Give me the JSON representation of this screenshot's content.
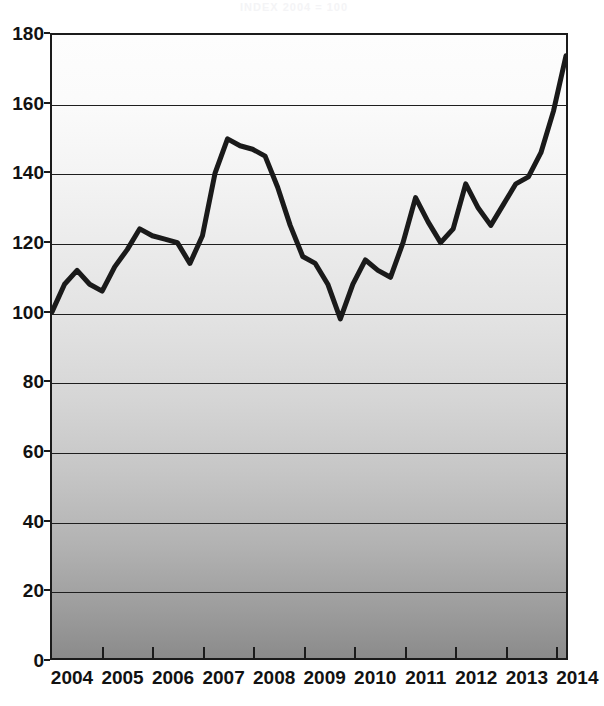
{
  "title": "INDEX 2004 = 100",
  "axes": {
    "y_ticks": [
      180,
      160,
      140,
      120,
      100,
      80,
      60,
      40,
      20,
      0
    ],
    "x_ticks": [
      "2004",
      "2005",
      "2006",
      "2007",
      "2008",
      "2009",
      "2010",
      "2011",
      "2012",
      "2013",
      "2014"
    ]
  },
  "chart_data": {
    "type": "line",
    "title": "INDEX 2004 = 100",
    "xlabel": "",
    "ylabel": "",
    "ylim": [
      0,
      180
    ],
    "xlim": [
      2004,
      2014.25
    ],
    "ytick_step": 20,
    "grid": true,
    "legend": "none",
    "line_color": "#1a1a1a",
    "line_width_px": 5,
    "background_gradient": [
      "#fdfdfd",
      "#8b8b8b"
    ],
    "x_unit": "quarter",
    "categories": [
      "2004 Q1",
      "2004 Q2",
      "2004 Q3",
      "2004 Q4",
      "2005 Q1",
      "2005 Q2",
      "2005 Q3",
      "2005 Q4",
      "2006 Q1",
      "2006 Q2",
      "2006 Q3",
      "2006 Q4",
      "2007 Q1",
      "2007 Q2",
      "2007 Q3",
      "2007 Q4",
      "2008 Q1",
      "2008 Q2",
      "2008 Q3",
      "2008 Q4",
      "2009 Q1",
      "2009 Q2",
      "2009 Q3",
      "2009 Q4",
      "2010 Q1",
      "2010 Q2",
      "2010 Q3",
      "2010 Q4",
      "2011 Q1",
      "2011 Q2",
      "2011 Q3",
      "2011 Q4",
      "2012 Q1",
      "2012 Q2",
      "2012 Q3",
      "2012 Q4",
      "2013 Q1",
      "2013 Q2",
      "2013 Q3",
      "2013 Q4",
      "2014 Q1",
      "2014 Q2"
    ],
    "x": [
      2004.0,
      2004.25,
      2004.5,
      2004.75,
      2005.0,
      2005.25,
      2005.5,
      2005.75,
      2006.0,
      2006.25,
      2006.5,
      2006.75,
      2007.0,
      2007.25,
      2007.5,
      2007.75,
      2008.0,
      2008.25,
      2008.5,
      2008.75,
      2009.0,
      2009.25,
      2009.5,
      2009.75,
      2010.0,
      2010.25,
      2010.5,
      2010.75,
      2011.0,
      2011.25,
      2011.5,
      2011.75,
      2012.0,
      2012.25,
      2012.5,
      2012.75,
      2013.0,
      2013.25,
      2013.5,
      2013.75,
      2014.0,
      2014.25
    ],
    "values": [
      100,
      108,
      112,
      108,
      106,
      113,
      118,
      124,
      122,
      121,
      120,
      114,
      122,
      140,
      150,
      148,
      147,
      145,
      136,
      125,
      116,
      114,
      108,
      98,
      108,
      115,
      112,
      110,
      120,
      133,
      126,
      120,
      124,
      137,
      130,
      125,
      131,
      137,
      139,
      146,
      158,
      174
    ],
    "series": [
      {
        "name": "Index",
        "values": [
          100,
          108,
          112,
          108,
          106,
          113,
          118,
          124,
          122,
          121,
          120,
          114,
          122,
          140,
          150,
          148,
          147,
          145,
          136,
          125,
          116,
          114,
          108,
          98,
          108,
          115,
          112,
          110,
          120,
          133,
          126,
          120,
          124,
          137,
          130,
          125,
          131,
          137,
          139,
          146,
          158,
          174
        ]
      }
    ],
    "annotations": {
      "start_value": 100,
      "peak_value": 150,
      "peak_at": "2007 Q3",
      "trough_value": 98,
      "trough_at": "2009 Q4",
      "end_value": 174,
      "end_at": "2014 Q2"
    }
  }
}
